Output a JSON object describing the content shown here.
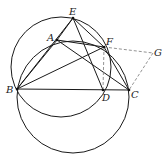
{
  "diagram": {
    "type": "geometry",
    "points": {
      "A": {
        "label": "A",
        "x": 57,
        "y": 40
      },
      "B": {
        "label": "B",
        "x": 17,
        "y": 89
      },
      "C": {
        "label": "C",
        "x": 129,
        "y": 90
      },
      "D": {
        "label": "D",
        "x": 103,
        "y": 90
      },
      "E": {
        "label": "E",
        "x": 73,
        "y": 18
      },
      "F": {
        "label": "F",
        "x": 104,
        "y": 47
      },
      "G": {
        "label": "G",
        "x": 153,
        "y": 53
      }
    },
    "circles": [
      {
        "name": "circle-EBDF",
        "cx": 61,
        "cy": 67,
        "r": 50
      },
      {
        "name": "circle-BAFC",
        "cx": 73,
        "cy": 97,
        "r": 56
      }
    ],
    "solid_segments": [
      "AB",
      "AC",
      "AE",
      "AF",
      "BC",
      "BE",
      "BF",
      "ED",
      "EF",
      "FC"
    ],
    "dashed_segments": [
      "FG",
      "GC",
      "FD",
      "EF"
    ],
    "line_color": "#1a1a1a",
    "dash_color": "#777777"
  }
}
